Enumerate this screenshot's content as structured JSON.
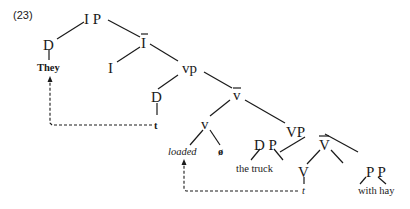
{
  "example_number": "(23)",
  "tree": {
    "IP": "I P",
    "D_subj": "D",
    "They": "They",
    "Ibar": "I",
    "I": "I",
    "vp": "vp",
    "D_trace": "D",
    "t_subj": "t",
    "vbar": "v",
    "v": "v",
    "loaded": "loaded",
    "null": "ø",
    "VP": "VP",
    "DP": "D P",
    "the_truck": "the truck",
    "Vbar": "V",
    "V": "V",
    "t_verb": "t",
    "PP": "P P",
    "with_hay": "with hay"
  }
}
